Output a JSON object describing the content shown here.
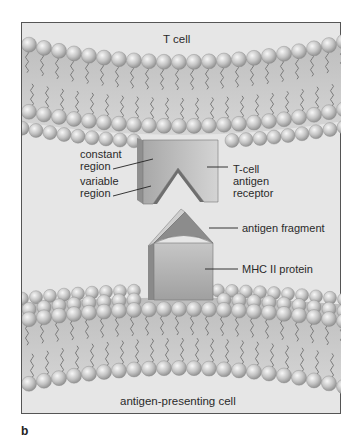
{
  "figure": {
    "panel_letter": "b",
    "top_cell_label": "T cell",
    "bottom_cell_label": "antigen-presenting cell",
    "labels": {
      "constant_region": "constant\nregion",
      "variable_region": "variable\nregion",
      "tcell_receptor": "T-cell\nantigen\nreceptor",
      "antigen_fragment": "antigen fragment",
      "mhc_protein": "MHC II protein"
    },
    "colors": {
      "background": "#e6e6e6",
      "frame": "#555555",
      "lipid_head": "#c8c8c8",
      "lipid_tail": "#7a7a7a",
      "protein_light": "#c9c9c9",
      "protein_dark": "#9a9a9a"
    }
  }
}
